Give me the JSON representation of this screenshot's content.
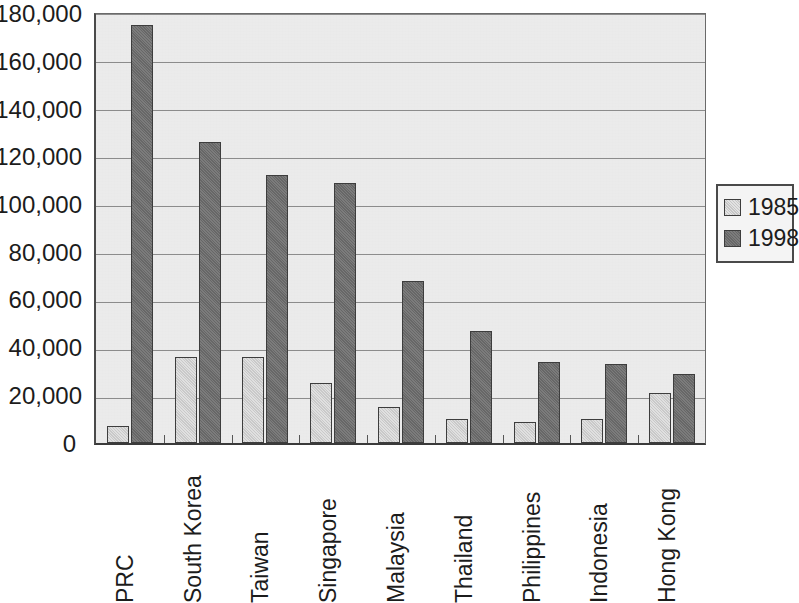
{
  "chart_data": {
    "type": "bar",
    "title": "",
    "subtitle": "",
    "xlabel": "",
    "ylabel": "",
    "ylim": [
      0,
      180000
    ],
    "ytick_step": 20000,
    "ytick_labels": [
      "180,000",
      "160,000",
      "140,000",
      "120,000",
      "100,000",
      "80,000",
      "60,000",
      "40,000",
      "20,000",
      "0"
    ],
    "ytick_values": [
      180000,
      160000,
      140000,
      120000,
      100000,
      80000,
      60000,
      40000,
      20000,
      0
    ],
    "grid": "horizontal",
    "legend_position": "right",
    "categories": [
      "PRC",
      "South Korea",
      "Taiwan",
      "Singapore",
      "Malaysia",
      "Thailand",
      "Philippines",
      "Indonesia",
      "Hong Kong"
    ],
    "series": [
      {
        "name": "1985",
        "color": "#cfcfcf",
        "values": [
          7000,
          36000,
          36000,
          25000,
          15000,
          10000,
          9000,
          10000,
          21000
        ]
      },
      {
        "name": "1998",
        "color": "#6d6d6d",
        "values": [
          175000,
          126000,
          112000,
          109000,
          68000,
          47000,
          34000,
          33000,
          29000
        ]
      }
    ],
    "annotations": []
  },
  "legend": {
    "items": [
      {
        "label": "1985",
        "swatch": "light-gray-swatch"
      },
      {
        "label": "1998",
        "swatch": "dark-gray-swatch"
      }
    ]
  }
}
